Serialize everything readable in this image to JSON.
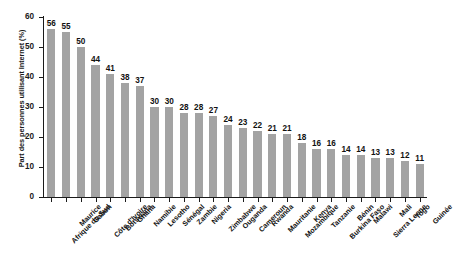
{
  "chart_data": {
    "type": "bar",
    "title": "",
    "subtitle": "",
    "xlabel": "",
    "ylabel": "Part des personnes utilisant Internet (%)",
    "ylim": [
      0,
      60
    ],
    "yticks": [
      0,
      10,
      20,
      30,
      40,
      50,
      60
    ],
    "grid": false,
    "legend": null,
    "bar_color": "#a3a3a3",
    "value_labels_shown": true,
    "categories": [
      "Afrique du Sud",
      "Maurice",
      "Gabon",
      "Côte d'Ivoire",
      "Botswana",
      "Ghana",
      "Namibie",
      "Lesotho",
      "Sénégal",
      "Zambie",
      "Nigeria",
      "Zimbabwe",
      "Ouganda",
      "Cameroun",
      "Rwanda",
      "Mauritanie",
      "Mozambique",
      "Kenya",
      "Tanzanie",
      "Burkina Faso",
      "Bénin",
      "Malawi",
      "Sierra Leone",
      "Mali",
      "Togo",
      "Guinée"
    ],
    "values": [
      56,
      55,
      50,
      44,
      41,
      38,
      37,
      30,
      30,
      28,
      28,
      27,
      24,
      23,
      22,
      21,
      21,
      18,
      16,
      16,
      14,
      14,
      13,
      13,
      12,
      11
    ]
  }
}
